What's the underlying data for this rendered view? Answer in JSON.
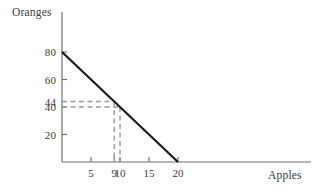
{
  "chart_data": {
    "type": "line",
    "title": "",
    "subtitle": "",
    "xlabel": "Apples",
    "ylabel": "Oranges",
    "xlim": [
      0,
      27.5
    ],
    "ylim": [
      0,
      92
    ],
    "grid": false,
    "legend": null,
    "x_ticks": [
      {
        "value": 5,
        "label": "5"
      },
      {
        "value": 9,
        "label": "9"
      },
      {
        "value": 10,
        "label": "10"
      },
      {
        "value": 15,
        "label": "15"
      },
      {
        "value": 20,
        "label": "20"
      }
    ],
    "y_ticks": [
      {
        "value": 80,
        "label": "80"
      },
      {
        "value": 60,
        "label": "60"
      },
      {
        "value": 44,
        "label": "44"
      },
      {
        "value": 40,
        "label": "40"
      },
      {
        "value": 20,
        "label": "20"
      }
    ],
    "series": [
      {
        "name": "budget-line",
        "type": "line",
        "style": "solid",
        "color": "#1a1a1a",
        "points": [
          {
            "x": 0,
            "y": 80
          },
          {
            "x": 20,
            "y": 0
          }
        ]
      }
    ],
    "annotations": [
      {
        "name": "guide-44-at-9",
        "style": "dashed",
        "color": "#9a9a9a",
        "x": 9,
        "y": 44,
        "segments": [
          {
            "from": {
              "x": 0,
              "y": 44
            },
            "to": {
              "x": 9,
              "y": 44
            }
          },
          {
            "from": {
              "x": 9,
              "y": 44
            },
            "to": {
              "x": 9,
              "y": 0
            }
          }
        ]
      },
      {
        "name": "guide-40-at-10",
        "style": "dashed",
        "color": "#9a9a9a",
        "x": 10,
        "y": 40,
        "segments": [
          {
            "from": {
              "x": 0,
              "y": 40
            },
            "to": {
              "x": 10,
              "y": 40
            }
          },
          {
            "from": {
              "x": 10,
              "y": 40
            },
            "to": {
              "x": 10,
              "y": 0
            }
          }
        ]
      }
    ]
  },
  "axes": {
    "y_title": "Oranges",
    "x_title": "Apples"
  },
  "colors": {
    "background": "#ffffff",
    "axis": "#6e6e6e",
    "line": "#1a1a1a",
    "guide": "#9a9a9a",
    "text": "#3b3b3b"
  }
}
